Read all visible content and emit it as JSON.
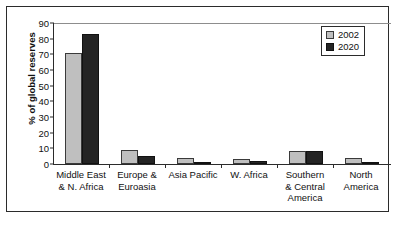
{
  "chart_data": {
    "type": "bar",
    "title": "",
    "xlabel": "",
    "ylabel": "% of global reserves",
    "ylim": [
      0,
      90
    ],
    "yticks": [
      0,
      10,
      20,
      30,
      40,
      50,
      60,
      70,
      80,
      90
    ],
    "grid": false,
    "legend_position": "top-right",
    "categories": [
      "Middle East\n& N. Africa",
      "Europe &\nEuroasia",
      "Asia Pacific",
      "W. Africa",
      "Southern\n& Central\nAmerica",
      "North\nAmerica"
    ],
    "category_lines": [
      [
        "Middle East",
        "& N. Africa"
      ],
      [
        "Europe &",
        "Euroasia"
      ],
      [
        "Asia Pacific"
      ],
      [
        "W. Africa"
      ],
      [
        "Southern",
        "& Central",
        "America"
      ],
      [
        "North",
        "America"
      ]
    ],
    "series": [
      {
        "name": "2002",
        "color": "#bfbfbf",
        "values": [
          71,
          9,
          4,
          3.5,
          8.5,
          4
        ]
      },
      {
        "name": "2020",
        "color": "#242424",
        "values": [
          83,
          5,
          1,
          2,
          8,
          1
        ]
      }
    ]
  },
  "legend": {
    "entries": [
      {
        "label": "2002",
        "swatch": "light-gray-swatch"
      },
      {
        "label": "2020",
        "swatch": "dark-swatch"
      }
    ]
  },
  "axis": {
    "y_title": "% of global reserves",
    "y_tick_labels": [
      "90",
      "80",
      "70",
      "60",
      "50",
      "40",
      "30",
      "20",
      "10",
      "0"
    ]
  }
}
